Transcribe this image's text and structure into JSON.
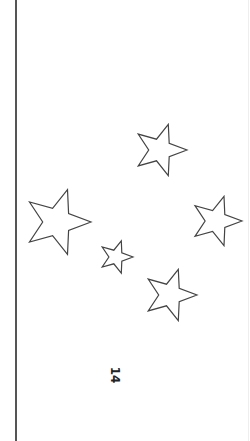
{
  "page": {
    "page_number": "14",
    "orientation": "rotated-90",
    "stroke_color": "#444444",
    "background": "#ffffff"
  },
  "stars": [
    {
      "cx": 160,
      "cy": 150,
      "r": 27
    },
    {
      "cx": 57,
      "cy": 222,
      "r": 34
    },
    {
      "cx": 216,
      "cy": 221,
      "r": 26
    },
    {
      "cx": 116,
      "cy": 257,
      "r": 17
    },
    {
      "cx": 170,
      "cy": 295,
      "r": 27
    }
  ]
}
